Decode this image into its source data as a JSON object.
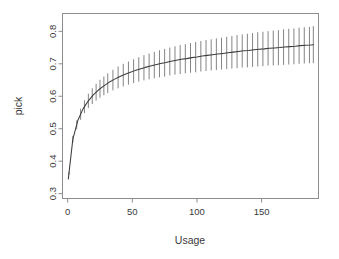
{
  "figure": {
    "background_color": "#ffffff",
    "frame_color": "#8d8d8d",
    "curve_color": "#3c3c3c",
    "errorbar_color": "#6e6e6e",
    "text_color": "#3a3a3a"
  },
  "chart_data": {
    "type": "line",
    "title": "",
    "subtitle": "",
    "xlabel": "Usage",
    "ylabel": "pick",
    "xlim": [
      -4,
      194
    ],
    "ylim": [
      0.285,
      0.855
    ],
    "grid": false,
    "legend": null,
    "annotations": [],
    "xticks": [
      0,
      50,
      100,
      150
    ],
    "xtick_labels": [
      "0",
      "50",
      "100",
      "150"
    ],
    "yticks": [
      0.3,
      0.4,
      0.5,
      0.6,
      0.7,
      0.8
    ],
    "ytick_labels": [
      "0.3",
      "0.4",
      "0.5",
      "0.6",
      "0.7",
      "0.8"
    ],
    "ytick_label_rotation": -90,
    "errorbar_style": "vertical-no-caps",
    "series": [
      {
        "name": "pick",
        "x": [
          0.5,
          4,
          8,
          12,
          16,
          20,
          24,
          28,
          32,
          36,
          40,
          44,
          48,
          52,
          56,
          60,
          64,
          68,
          72,
          76,
          80,
          84,
          88,
          92,
          96,
          100,
          104,
          108,
          112,
          116,
          120,
          124,
          128,
          132,
          136,
          140,
          144,
          148,
          152,
          156,
          160,
          164,
          168,
          172,
          176,
          180,
          184,
          188,
          190
        ],
        "y": [
          0.345,
          0.468,
          0.527,
          0.562,
          0.586,
          0.605,
          0.62,
          0.632,
          0.643,
          0.652,
          0.66,
          0.667,
          0.673,
          0.679,
          0.684,
          0.689,
          0.693,
          0.697,
          0.701,
          0.704,
          0.708,
          0.711,
          0.714,
          0.716,
          0.719,
          0.721,
          0.724,
          0.726,
          0.728,
          0.73,
          0.732,
          0.734,
          0.736,
          0.738,
          0.74,
          0.741,
          0.743,
          0.745,
          0.746,
          0.748,
          0.749,
          0.75,
          0.752,
          0.753,
          0.754,
          0.756,
          0.757,
          0.758,
          0.759
        ],
        "yerr": [
          0.004,
          0.01,
          0.015,
          0.019,
          0.022,
          0.025,
          0.027,
          0.029,
          0.031,
          0.032,
          0.034,
          0.035,
          0.036,
          0.037,
          0.038,
          0.039,
          0.04,
          0.041,
          0.042,
          0.043,
          0.043,
          0.044,
          0.045,
          0.045,
          0.046,
          0.047,
          0.047,
          0.048,
          0.048,
          0.049,
          0.049,
          0.05,
          0.05,
          0.051,
          0.051,
          0.052,
          0.052,
          0.053,
          0.053,
          0.053,
          0.054,
          0.054,
          0.055,
          0.055,
          0.055,
          0.056,
          0.056,
          0.056,
          0.057
        ]
      }
    ],
    "errorbar_x": [
      1,
      4,
      7,
      10,
      13,
      16,
      19,
      22,
      25,
      28,
      31,
      35,
      39,
      43,
      47,
      51,
      55,
      59,
      63,
      67,
      71,
      75,
      79,
      83,
      87,
      91,
      95,
      99,
      103,
      107,
      111,
      115,
      119,
      123,
      127,
      131,
      135,
      139,
      143,
      147,
      151,
      155,
      159,
      163,
      167,
      171,
      175,
      179,
      183,
      187,
      190
    ]
  }
}
